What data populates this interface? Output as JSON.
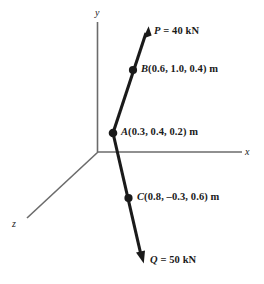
{
  "figure": {
    "background_color": "#ffffff",
    "axis_color": "#6b6b6b",
    "line_color": "#1a1a1a",
    "text_color": "#1a1a1a",
    "axes": [
      {
        "name": "y-axis",
        "label": "y"
      },
      {
        "name": "x-axis",
        "label": "x"
      },
      {
        "name": "z-axis",
        "label": "z"
      }
    ],
    "forces": {
      "p": {
        "symbol": "P",
        "rest": " = 40 kN",
        "full": "P = 40 kN",
        "magnitude": 40,
        "unit": "kN",
        "direction": "up-right"
      },
      "q": {
        "symbol": "Q",
        "rest": " = 50 kN",
        "full": "Q = 50 kN",
        "magnitude": 50,
        "unit": "kN",
        "direction": "down-right"
      }
    },
    "points": {
      "a": {
        "symbol": "A",
        "rest": "(0.3, 0.4, 0.2) m",
        "full": "A(0.3, 0.4, 0.2) m",
        "coords": [
          0.3,
          0.4,
          0.2
        ],
        "unit": "m"
      },
      "b": {
        "symbol": "B",
        "rest": "(0.6, 1.0, 0.4) m",
        "full": "B(0.6, 1.0, 0.4) m",
        "coords": [
          0.6,
          1.0,
          0.4
        ],
        "unit": "m"
      },
      "c": {
        "symbol": "C",
        "rest": "(0.8, –0.3, 0.6) m",
        "full": "C(0.8, –0.3, 0.6) m",
        "coords": [
          0.8,
          -0.3,
          0.6
        ],
        "unit": "m"
      }
    }
  }
}
